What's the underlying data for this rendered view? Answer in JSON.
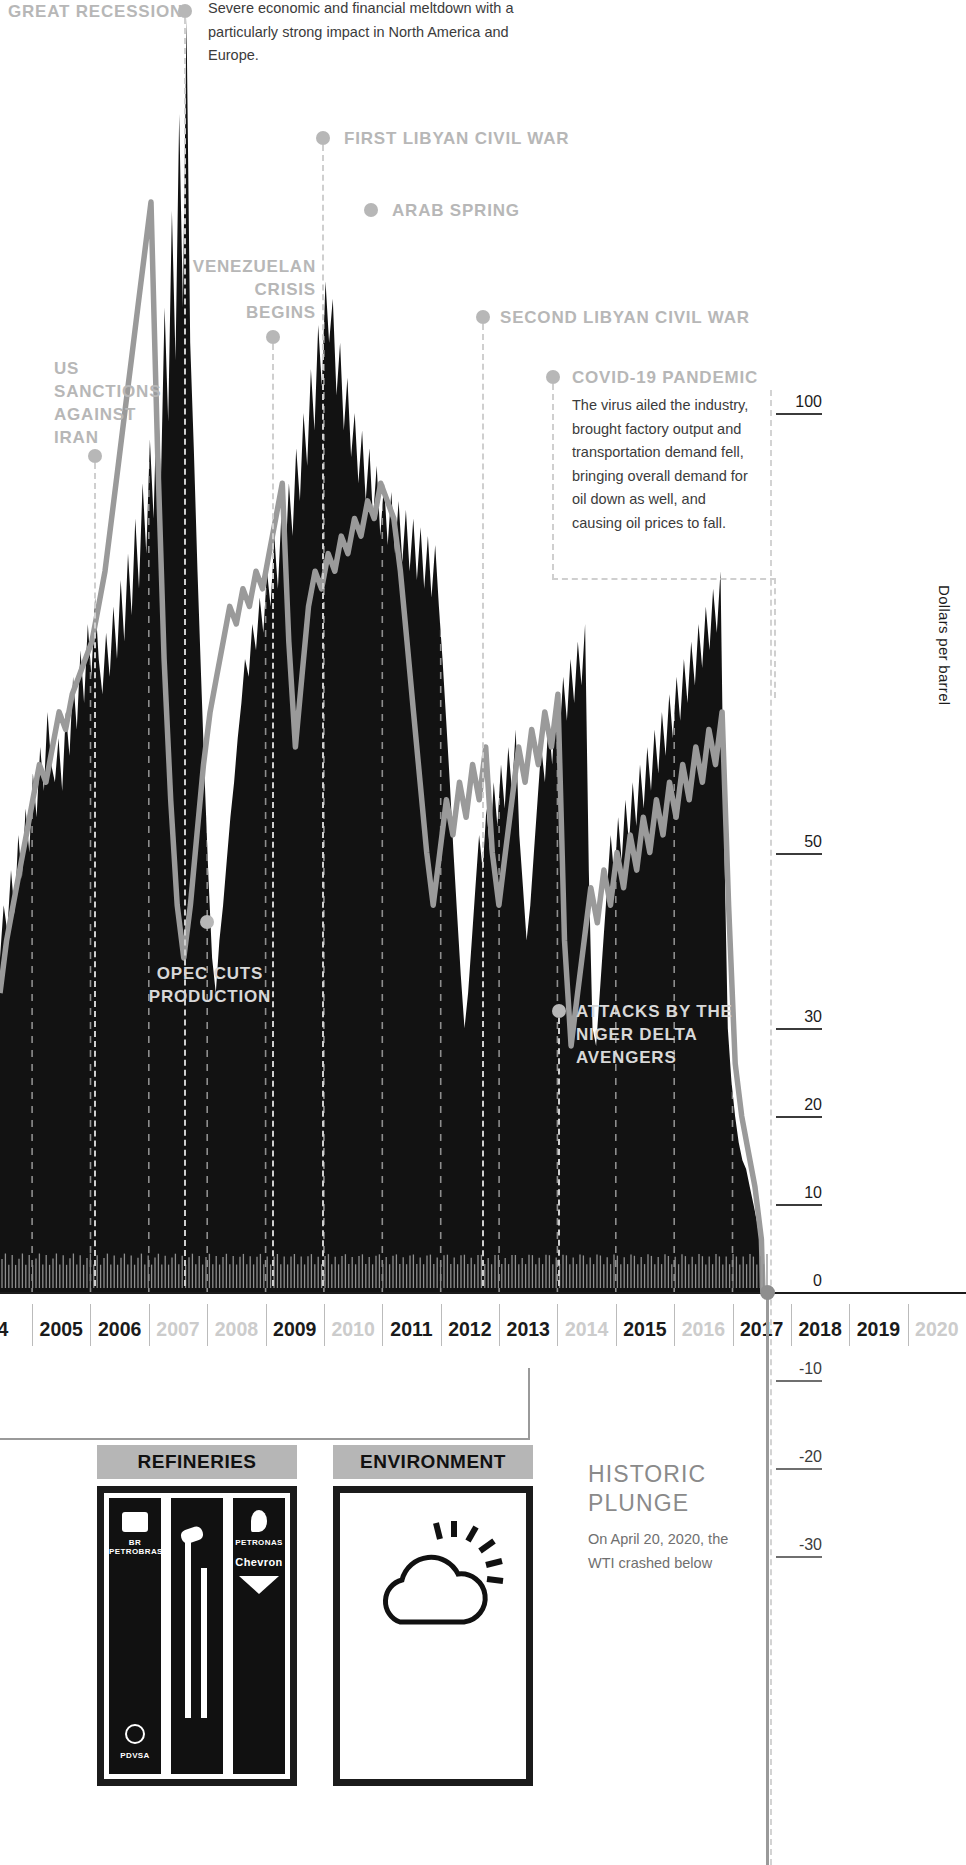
{
  "chart_data": {
    "type": "area",
    "ylabel": "Dollars per barrel",
    "xlabel": "",
    "ylim": [
      -37,
      115
    ],
    "grid": true,
    "legend_position": "none",
    "y_ticks": [
      {
        "value": 100,
        "label": "100"
      },
      {
        "value": 50,
        "label": "50"
      },
      {
        "value": 30,
        "label": "30"
      },
      {
        "value": 20,
        "label": "20"
      },
      {
        "value": 10,
        "label": "10"
      },
      {
        "value": 0,
        "label": "0"
      },
      {
        "value": -10,
        "label": "-10"
      },
      {
        "value": -20,
        "label": "-20"
      },
      {
        "value": -30,
        "label": "-30"
      }
    ],
    "x_tick_labels": [
      "4",
      "2005",
      "2006",
      "2007",
      "2008",
      "2009",
      "2010",
      "2011",
      "2012",
      "2013",
      "2014",
      "2015",
      "2016",
      "2017",
      "2018",
      "2019",
      "2020"
    ],
    "x_tick_dimmed": [
      false,
      false,
      false,
      true,
      true,
      false,
      true,
      false,
      false,
      false,
      true,
      false,
      true,
      false,
      false,
      false,
      true
    ],
    "series": [
      {
        "name": "Daily spot price (area)",
        "style": "dark-area",
        "color": "#141414",
        "values": [
          38,
          44,
          41,
          48,
          43,
          52,
          47,
          55,
          50,
          59,
          54,
          62,
          57,
          66,
          60,
          58,
          63,
          57,
          66,
          61,
          70,
          64,
          73,
          67,
          76,
          70,
          79,
          72,
          68,
          75,
          70,
          78,
          72,
          81,
          74,
          84,
          77,
          88,
          80,
          92,
          84,
          97,
          88,
          104,
          92,
          112,
          99,
          123,
          106,
          134,
          112,
          145,
          108,
          96,
          82,
          70,
          58,
          47,
          38,
          34,
          40,
          44,
          49,
          54,
          58,
          63,
          67,
          72,
          70,
          76,
          73,
          79,
          75,
          82,
          78,
          86,
          80,
          89,
          83,
          92,
          86,
          96,
          90,
          100,
          94,
          105,
          98,
          110,
          103,
          115,
          108,
          113,
          102,
          108,
          98,
          104,
          95,
          100,
          92,
          98,
          90,
          96,
          88,
          94,
          86,
          92,
          85,
          91,
          84,
          90,
          83,
          89,
          82,
          88,
          81,
          87,
          80,
          86,
          79,
          85,
          78,
          72,
          65,
          58,
          50,
          43,
          36,
          30,
          34,
          40,
          46,
          52,
          48,
          55,
          50,
          58,
          53,
          60,
          55,
          62,
          57,
          64,
          52,
          46,
          40,
          44,
          50,
          56,
          62,
          58,
          65,
          60,
          68,
          63,
          70,
          65,
          72,
          67,
          74,
          69,
          76,
          48,
          30,
          28,
          34,
          40,
          46,
          52,
          47,
          54,
          49,
          56,
          51,
          58,
          53,
          60,
          55,
          62,
          57,
          64,
          59,
          66,
          61,
          68,
          63,
          70,
          65,
          72,
          67,
          74,
          69,
          76,
          71,
          78,
          73,
          80,
          75,
          82,
          52,
          30,
          24,
          20,
          17,
          15,
          14,
          12,
          10,
          8,
          5,
          2,
          -37
        ],
        "notes": "Black filled area is the high-frequency daily price envelope; values are approximations read from the chart."
      },
      {
        "name": "Smoothed trend",
        "style": "gray-line",
        "color": "#9a9a9a",
        "values": [
          34,
          40,
          44,
          48,
          52,
          56,
          60,
          58,
          62,
          66,
          64,
          68,
          70,
          72,
          74,
          78,
          82,
          88,
          94,
          100,
          106,
          112,
          118,
          124,
          96,
          72,
          56,
          44,
          38,
          44,
          52,
          60,
          66,
          70,
          74,
          78,
          76,
          80,
          78,
          82,
          80,
          84,
          88,
          92,
          74,
          62,
          70,
          78,
          82,
          80,
          84,
          82,
          86,
          84,
          88,
          86,
          90,
          88,
          92,
          90,
          88,
          82,
          74,
          66,
          58,
          50,
          44,
          50,
          56,
          52,
          58,
          54,
          60,
          56,
          62,
          50,
          44,
          50,
          56,
          62,
          58,
          64,
          60,
          66,
          62,
          68,
          40,
          28,
          34,
          40,
          46,
          42,
          48,
          44,
          50,
          46,
          52,
          48,
          54,
          50,
          56,
          52,
          58,
          54,
          60,
          56,
          62,
          58,
          64,
          60,
          66,
          44,
          26,
          20,
          16,
          12,
          6,
          -20
        ]
      }
    ]
  },
  "yaxis": {
    "title": "Dollars per barrel"
  },
  "events": [
    {
      "id": "great-recession",
      "label": "GREAT RECESSION",
      "body": "Severe economic and financial meltdown with a particularly strong impact in North America and Europe.",
      "year": "2008"
    },
    {
      "id": "first-libyan-civil-war",
      "label": "FIRST LIBYAN CIVIL WAR",
      "body": "",
      "year": "2011"
    },
    {
      "id": "arab-spring",
      "label": "ARAB SPRING",
      "body": "",
      "year": "2011"
    },
    {
      "id": "venezuelan-crisis-begins",
      "label": "VENEZUELAN CRISIS BEGINS",
      "body": "",
      "year": "2010"
    },
    {
      "id": "second-libyan-civil-war",
      "label": "SECOND LIBYAN CIVIL WAR",
      "body": "",
      "year": "2014"
    },
    {
      "id": "covid-19-pandemic",
      "label": "COVID-19 PANDEMIC",
      "body": "The virus ailed the industry, brought factory output and transportation demand fell, bringing overall demand for oil down as well, and causing oil prices to fall.",
      "year": "2020"
    },
    {
      "id": "us-sanctions-against-iran",
      "label": "US SANCTIONS AGAINST IRAN",
      "body": "",
      "year": "2006"
    },
    {
      "id": "opec-cuts-production",
      "label": "OPEC CUTS PRODUCTION",
      "body": "",
      "year": "2008"
    },
    {
      "id": "attacks-by-the-niger-delta-avengers",
      "label": "ATTACKS BY THE NIGER DELTA AVENGERS",
      "body": "",
      "year": "2016"
    }
  ],
  "cards": [
    {
      "id": "refineries",
      "title": "REFINERIES",
      "logos": [
        "BR PETROBRAS",
        "PDVSA",
        "PETRONAS",
        "Chevron"
      ]
    },
    {
      "id": "environment",
      "title": "ENVIRONMENT",
      "logos": []
    }
  ],
  "plunge": {
    "title": "HISTORIC PLUNGE",
    "body": "On April 20, 2020, the WTI crashed below"
  }
}
